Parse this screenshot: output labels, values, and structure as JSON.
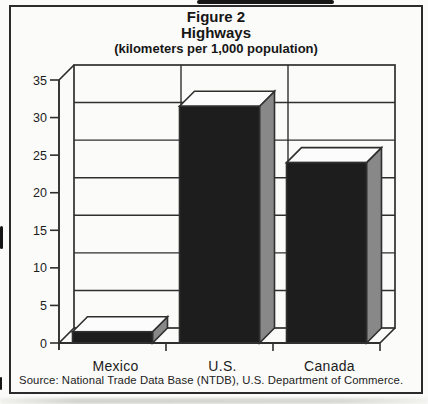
{
  "figure": {
    "title_line1": "Figure 2",
    "title_line2": "Highways",
    "subtitle": "(kilometers per 1,000 population)",
    "source": "Source: National Trade Data Base (NTDB), U.S. Department of Commerce."
  },
  "chart_data": {
    "type": "bar",
    "style": "3d-column",
    "subtitle": "(kilometers per 1,000 population)",
    "categories": [
      "Mexico",
      "U.S.",
      "Canada"
    ],
    "values": [
      1.5,
      31.5,
      24
    ],
    "xlabel": "",
    "ylabel": "kilometers per 1,000 population",
    "ylim": [
      0,
      35
    ],
    "ytick_step": 5,
    "grid": true,
    "legend": false,
    "colors": {
      "bar_front": "#1d1d1d",
      "bar_side": "#888888",
      "bar_top": "#fcfcfc",
      "line": "#2f2f2f",
      "text": "#1c1c1c",
      "paper": "#fbfbf9"
    }
  }
}
